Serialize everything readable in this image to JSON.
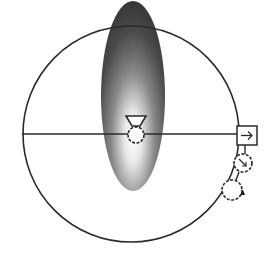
{
  "diagram": {
    "type": "schematic",
    "colors": {
      "background": "#ffffff",
      "stroke": "#2a2a2a",
      "ellipse_dark": "#3a3a3a",
      "ellipse_light": "#ffffff"
    },
    "loop": {
      "cx": 131,
      "cy": 134,
      "r": 108
    },
    "beam_ellipse": {
      "cx": 133,
      "cy": 96,
      "rx": 32,
      "ry": 95
    },
    "horizontal_line": {
      "x1": 22,
      "y1": 134,
      "x2": 237,
      "y2": 134
    },
    "components": [
      {
        "id": "center-funnel",
        "icon": "funnel-icon"
      },
      {
        "id": "center-dashed-circle",
        "icon": "dashed-circle-icon"
      },
      {
        "id": "arrow-box",
        "icon": "right-arrow-box-icon",
        "glyph": "→"
      },
      {
        "id": "dashed-circle-arrow",
        "icon": "dashed-circle-diagonal-arrow-icon"
      },
      {
        "id": "dashed-circle-triangle",
        "icon": "dashed-circle-triangle-icon"
      }
    ]
  }
}
